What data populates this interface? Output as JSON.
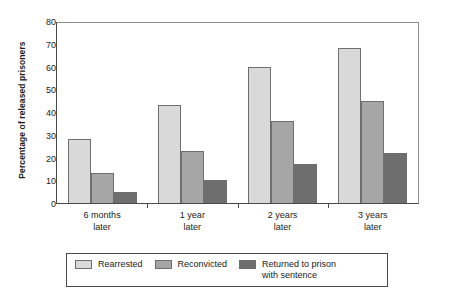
{
  "chart_data": {
    "type": "bar",
    "title": "",
    "xlabel": "",
    "ylabel": "Percentage of released prisoners",
    "ylim": [
      0,
      80
    ],
    "yticks": [
      0,
      10,
      20,
      30,
      40,
      50,
      60,
      70,
      80
    ],
    "grid": false,
    "legend_position": "bottom",
    "categories": [
      "6 months later",
      "1 year later",
      "2 years later",
      "3 years later"
    ],
    "category_lines": [
      [
        "6 months",
        "later"
      ],
      [
        "1 year",
        "later"
      ],
      [
        "2 years",
        "later"
      ],
      [
        "3 years",
        "later"
      ]
    ],
    "series": [
      {
        "name": "Rearrested",
        "color": "#d9d9d9",
        "values": [
          28,
          43,
          60,
          68
        ]
      },
      {
        "name": "Reconvicted",
        "color": "#a6a6a6",
        "values": [
          13,
          23,
          36,
          45
        ]
      },
      {
        "name": "Returned to prison with sentence",
        "color": "#6e6e6e",
        "values": [
          5,
          10,
          17,
          22
        ]
      }
    ]
  },
  "legend": {
    "items": [
      {
        "label": "Rearrested"
      },
      {
        "label": "Reconvicted"
      },
      {
        "label": "Returned to prison with sentence"
      }
    ]
  },
  "colors": {
    "series_light": "#d9d9d9",
    "series_medium": "#a6a6a6",
    "series_dark": "#6e6e6e",
    "axis": "#4a4a4a",
    "frame": "#8d8d8d",
    "text": "#1a1a1a",
    "background": "#ffffff"
  }
}
